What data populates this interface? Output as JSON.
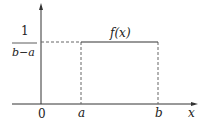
{
  "diagram": {
    "function_label": "f(x)",
    "height_numerator": "1",
    "height_denominator": "b−a",
    "x_axis_label": "x",
    "origin_label": "0",
    "left_bound_label": "a",
    "right_bound_label": "b",
    "colors": {
      "line": "#333333",
      "dashed": "#666666"
    }
  }
}
